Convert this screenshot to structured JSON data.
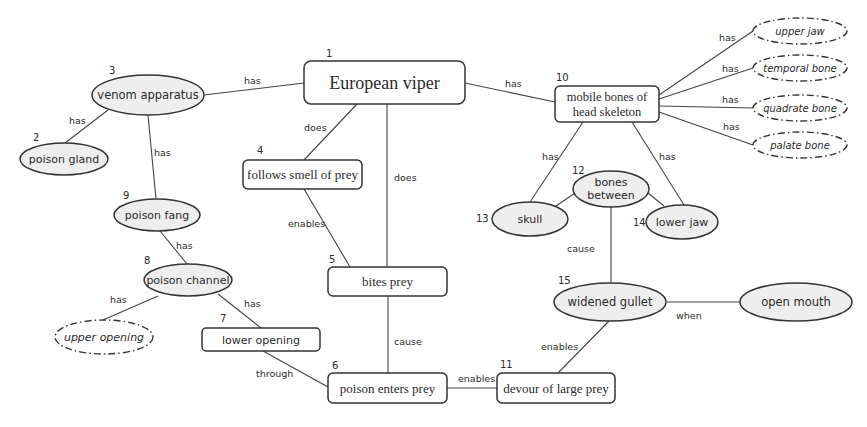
{
  "colors": {
    "line": "#444444",
    "oval_fill": "#eeeeee",
    "box_fill": "#ffffff",
    "stroke": "#333333"
  },
  "nodes": {
    "n1": {
      "num": "1",
      "label": "European viper",
      "shape": "rounded-box"
    },
    "n2": {
      "num": "2",
      "label": "poison gland",
      "shape": "oval"
    },
    "n3": {
      "num": "3",
      "label": "venom apparatus",
      "shape": "oval"
    },
    "n4": {
      "num": "4",
      "label": "follows smell of prey",
      "shape": "rounded-box"
    },
    "n5": {
      "num": "5",
      "label": "bites prey",
      "shape": "rounded-box"
    },
    "n6": {
      "num": "6",
      "label": "poison enters prey",
      "shape": "rounded-box"
    },
    "n7": {
      "num": "7",
      "label": "lower opening",
      "shape": "rounded-box"
    },
    "n8": {
      "num": "8",
      "label": "poison channel",
      "shape": "oval"
    },
    "n9": {
      "num": "9",
      "label": "poison fang",
      "shape": "oval"
    },
    "n10": {
      "num": "10",
      "label_line1": "mobile bones of",
      "label_line2": "head skeleton",
      "shape": "rounded-box"
    },
    "n11": {
      "num": "11",
      "label": "devour of large prey",
      "shape": "rounded-box"
    },
    "n12": {
      "num": "12",
      "label_line1": "bones",
      "label_line2": "between",
      "shape": "oval"
    },
    "n13": {
      "num": "13",
      "label": "skull",
      "shape": "oval"
    },
    "n14": {
      "num": "14",
      "label": "lower jaw",
      "shape": "oval"
    },
    "n15": {
      "num": "15",
      "label": "widened gullet",
      "shape": "oval"
    },
    "open_mouth": {
      "label": "open mouth",
      "shape": "oval"
    },
    "upper_opening": {
      "label": "upper opening",
      "shape": "dashed-oval"
    },
    "upper_jaw": {
      "label": "upper jaw",
      "shape": "dashed-oval"
    },
    "temporal_bone": {
      "label": "temporal bone",
      "shape": "dashed-oval"
    },
    "quadrate_bone": {
      "label": "quadrate bone",
      "shape": "dashed-oval"
    },
    "palate_bone": {
      "label": "palate bone",
      "shape": "dashed-oval"
    }
  },
  "edges": [
    {
      "from": "n3",
      "to": "n1",
      "label": "has"
    },
    {
      "from": "n3",
      "to": "n2",
      "label": "has"
    },
    {
      "from": "n3",
      "to": "n9",
      "label": "has"
    },
    {
      "from": "n1",
      "to": "n4",
      "label": "does"
    },
    {
      "from": "n1",
      "to": "n5",
      "label": "does"
    },
    {
      "from": "n1",
      "to": "n10",
      "label": "has"
    },
    {
      "from": "n4",
      "to": "n5",
      "label": "enables"
    },
    {
      "from": "n9",
      "to": "n8",
      "label": "has"
    },
    {
      "from": "n8",
      "to": "upper_opening",
      "label": "has"
    },
    {
      "from": "n8",
      "to": "n7",
      "label": "has"
    },
    {
      "from": "n7",
      "to": "n6",
      "label": "through"
    },
    {
      "from": "n5",
      "to": "n6",
      "label": "cause"
    },
    {
      "from": "n6",
      "to": "n11",
      "label": "enables"
    },
    {
      "from": "n15",
      "to": "n11",
      "label": "enables"
    },
    {
      "from": "n15",
      "to": "open_mouth",
      "label": "when"
    },
    {
      "from": "n12",
      "to": "n15",
      "label": "cause"
    },
    {
      "from": "n10",
      "to": "n13",
      "label": "has"
    },
    {
      "from": "n10",
      "to": "n14",
      "label": "has"
    },
    {
      "from": "n12",
      "to": "n13",
      "label": ""
    },
    {
      "from": "n12",
      "to": "n14",
      "label": ""
    },
    {
      "from": "n10",
      "to": "upper_jaw",
      "label": "has"
    },
    {
      "from": "n10",
      "to": "temporal_bone",
      "label": "has"
    },
    {
      "from": "n10",
      "to": "quadrate_bone",
      "label": "has"
    },
    {
      "from": "n10",
      "to": "palate_bone",
      "label": "has"
    }
  ]
}
